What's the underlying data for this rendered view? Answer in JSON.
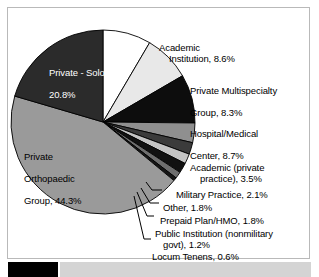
{
  "figure": {
    "background_color": "#ffffff",
    "frame_color": "#b9b9b9"
  },
  "bottom_bar": {
    "black_block_color": "#000000",
    "gray_strip_color": "#d4d4d4"
  },
  "chart_data": {
    "type": "pie",
    "title": "",
    "subtitle": "",
    "xlabel": "",
    "ylabel": "",
    "legend_position": "none",
    "grid": false,
    "total_percent": 101.9,
    "units": "percent",
    "center": {
      "x": 103,
      "y": 122
    },
    "radius": 92,
    "start_angle_deg": -90,
    "direction": "clockwise",
    "categories": [
      "Academic Institution",
      "Private Multispecialty Group",
      "Hospital/Medical Center",
      "Academic (private practice)",
      "Military Practice",
      "Other",
      "Prepaid Plan/HMO",
      "Public Institution (nonmilitary govt)",
      "Locum Tenens",
      "Private Orthopaedic Group",
      "Private - Solo"
    ],
    "values": [
      8.6,
      8.3,
      8.7,
      3.5,
      2.1,
      1.8,
      1.8,
      1.2,
      0.6,
      44.3,
      20.8
    ],
    "slices": [
      {
        "name": "Academic Institution",
        "value": 8.6,
        "value_label": "8.6%",
        "label": "Academic\nInstitution, 8.6%",
        "label_line1": "Academic",
        "label_line2": "Institution, 8.6%",
        "color": "#ffffff",
        "label_placement": "outside",
        "label_text_color": "#000000"
      },
      {
        "name": "Private Multispecialty Group",
        "value": 8.3,
        "value_label": "8.3%",
        "label": "Private Multispecialty\nGroup, 8.3%",
        "label_line1": "Private Multispecialty",
        "label_line2": "Group, 8.3%",
        "color": "#e8e8e8",
        "label_placement": "outside",
        "label_text_color": "#000000"
      },
      {
        "name": "Hospital/Medical Center",
        "value": 8.7,
        "value_label": "8.7%",
        "label": "Hospital/Medical\nCenter, 8.7%",
        "label_line1": "Hospital/Medical",
        "label_line2": "Center, 8.7%",
        "color": "#0d0d0d",
        "label_placement": "outside",
        "label_text_color": "#000000"
      },
      {
        "name": "Academic (private practice)",
        "value": 3.5,
        "value_label": "3.5%",
        "label": "Academic (private\npractice), 3.5%",
        "label_line1": "Academic (private",
        "label_line2": "practice), 3.5%",
        "color": "#8f8f8f",
        "label_placement": "outside",
        "label_text_color": "#000000"
      },
      {
        "name": "Military Practice",
        "value": 2.1,
        "value_label": "2.1%",
        "label": "Military Practice, 2.1%",
        "label_line1": "Military Practice, 2.1%",
        "label_line2": "",
        "color": "#3b3b3b",
        "label_placement": "outside",
        "label_text_color": "#000000"
      },
      {
        "name": "Other",
        "value": 1.8,
        "value_label": "1.8%",
        "label": "Other, 1.8%",
        "label_line1": "Other, 1.8%",
        "label_line2": "",
        "color": "#c4c4c4",
        "label_placement": "callout",
        "label_text_color": "#000000"
      },
      {
        "name": "Prepaid Plan/HMO",
        "value": 1.8,
        "value_label": "1.8%",
        "label": "Prepaid Plan/HMO, 1.8%",
        "label_line1": "Prepaid Plan/HMO, 1.8%",
        "label_line2": "",
        "color": "#111111",
        "label_placement": "callout",
        "label_text_color": "#000000"
      },
      {
        "name": "Public Institution (nonmilitary govt)",
        "value": 1.2,
        "value_label": "1.2%",
        "label": "Public Institution (nonmilitary\ngovt), 1.2%",
        "label_line1": "Public Institution (nonmilitary",
        "label_line2": "govt), 1.2%",
        "color": "#6e6e6e",
        "label_placement": "callout",
        "label_text_color": "#000000"
      },
      {
        "name": "Locum Tenens",
        "value": 0.6,
        "value_label": "0.6%",
        "label": "Locum Tenens, 0.6%",
        "label_line1": "Locum Tenens, 0.6%",
        "label_line2": "",
        "color": "#161616",
        "label_placement": "callout",
        "label_text_color": "#000000"
      },
      {
        "name": "Private Orthopaedic Group",
        "value": 44.3,
        "value_label": "44.3%",
        "label": "Private\nOrthopaedic\nGroup, 44.3%",
        "label_line1": "Private",
        "label_line2": "Orthopaedic",
        "label_line3": "Group, 44.3%",
        "color": "#9a9a9a",
        "label_placement": "inside",
        "label_text_color": "#000000"
      },
      {
        "name": "Private - Solo",
        "value": 20.8,
        "value_label": "20.8%",
        "label": "Private - Solo,\n20.8%",
        "label_line1": "Private - Solo,",
        "label_line2": "20.8%",
        "color": "#2b2b2b",
        "label_placement": "inside",
        "label_text_color": "#ffffff"
      }
    ]
  }
}
